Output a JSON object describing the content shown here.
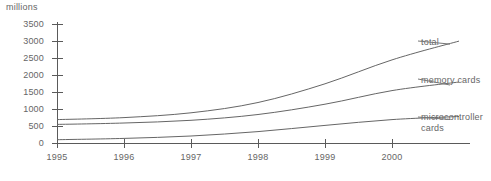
{
  "chart_data": {
    "type": "line",
    "title": "",
    "ylabel": "millions",
    "xlabel": "",
    "ylim": [
      0,
      3500
    ],
    "ytick_labels": [
      "3500",
      "3000",
      "2500",
      "2000",
      "1500",
      "1000",
      "500",
      "0"
    ],
    "ytick_values": [
      3500,
      3000,
      2500,
      2000,
      1500,
      1000,
      500,
      0
    ],
    "xtick_labels": [
      "1995",
      "1996",
      "1997",
      "1998",
      "1999",
      "2000"
    ],
    "x": [
      1995,
      1996,
      1997,
      1998,
      1999,
      2000,
      2001
    ],
    "grid": false,
    "legend_position": "right-inline-labels",
    "series": [
      {
        "name": "total",
        "label": "total",
        "values": [
          700,
          760,
          900,
          1200,
          1750,
          2450,
          3000
        ],
        "color": "#666666"
      },
      {
        "name": "memory cards",
        "label": "memory cards",
        "values": [
          560,
          600,
          680,
          850,
          1150,
          1550,
          1800
        ],
        "color": "#666666"
      },
      {
        "name": "microcontroller cards",
        "label_line1": "microcontroller",
        "label_line2": "cards",
        "label": "microcontroller cards",
        "values": [
          110,
          150,
          220,
          350,
          530,
          700,
          790
        ],
        "color": "#666666"
      }
    ]
  },
  "axis": {
    "y_title": "millions"
  },
  "labels": {
    "total": "total",
    "memory_cards": "memory cards",
    "microcontroller_line1": "microcontroller",
    "microcontroller_line2": "cards"
  },
  "yticks": [
    {
      "text": "3500"
    },
    {
      "text": "3000"
    },
    {
      "text": "2500"
    },
    {
      "text": "2000"
    },
    {
      "text": "1500"
    },
    {
      "text": "1000"
    },
    {
      "text": "500"
    },
    {
      "text": "0"
    }
  ],
  "xticks": [
    {
      "text": "1995"
    },
    {
      "text": "1996"
    },
    {
      "text": "1997"
    },
    {
      "text": "1998"
    },
    {
      "text": "1999"
    },
    {
      "text": "2000"
    }
  ],
  "colors": {
    "axis": "#5a5a5a",
    "curve": "#666666",
    "text": "#666666",
    "background": "#ffffff"
  }
}
